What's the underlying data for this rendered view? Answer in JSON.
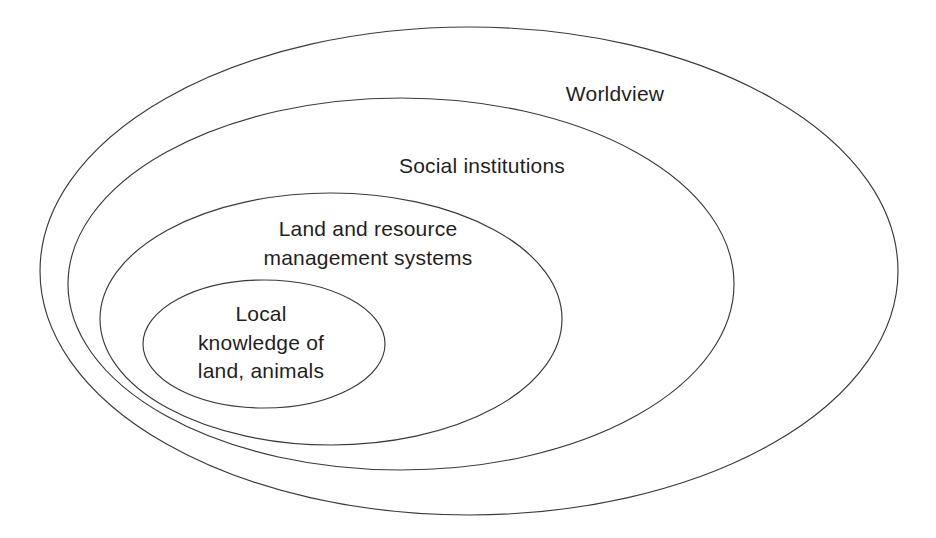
{
  "diagram": {
    "type": "nested-ellipses",
    "background_color": "#ffffff",
    "stroke_color": "#3a3a3a",
    "text_color": "#1f1f1f",
    "levels": [
      {
        "id": "worldview",
        "label": "Worldview"
      },
      {
        "id": "social-institutions",
        "label": "Social institutions"
      },
      {
        "id": "land-resource-management",
        "label": "Land and resource\nmanagement systems"
      },
      {
        "id": "local-knowledge",
        "label": "Local\nknowledge of\nland, animals"
      }
    ]
  }
}
